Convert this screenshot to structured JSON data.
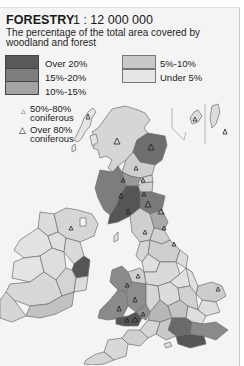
{
  "header": {
    "title": "FORESTRY",
    "scale": "1 : 12 000 000",
    "subtitle": "The percentage of the total area covered by woodland and forest"
  },
  "legend": {
    "classes": [
      {
        "label": "Over 20%",
        "color": "#595959"
      },
      {
        "label": "15%-20%",
        "color": "#7d7d7d"
      },
      {
        "label": "10%-15%",
        "color": "#a3a3a3"
      },
      {
        "label": "5%-10%",
        "color": "#c9c9c9"
      },
      {
        "label": "Under 5%",
        "color": "#e4e4e4"
      }
    ],
    "symbols": [
      {
        "icon": "small-triangle-icon",
        "glyph": "△",
        "label_line1": "50%-80%",
        "label_line2": "coniferous"
      },
      {
        "icon": "large-triangle-icon",
        "glyph": "△",
        "label_line1": "Over 80%",
        "label_line2": "coniferous"
      }
    ]
  },
  "map": {
    "region": "British Isles",
    "border_color": "#6e6e6e",
    "sea_color": "#f4f4f4"
  }
}
